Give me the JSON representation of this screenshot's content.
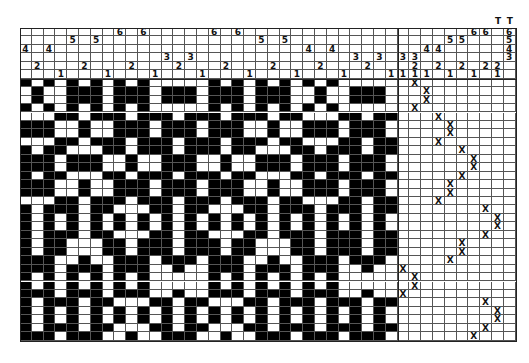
{
  "draft": {
    "shafts": 6,
    "threading": [
      4,
      2,
      4,
      1,
      5,
      2,
      5,
      1,
      6,
      2,
      6,
      1,
      3,
      2,
      3,
      1,
      6,
      2,
      6,
      1,
      5,
      2,
      5,
      1,
      4,
      2,
      4,
      1,
      3,
      2,
      3,
      1
    ],
    "tieup": [
      [
        3,
        1
      ],
      [
        3,
        2,
        1
      ],
      [
        4,
        1
      ],
      [
        4,
        2
      ],
      [
        5,
        1
      ],
      [
        5,
        2
      ],
      [
        6,
        1
      ],
      [
        6,
        2
      ],
      [
        2,
        1
      ],
      [
        6,
        5,
        4,
        3
      ]
    ],
    "tabby_labels": [
      "T",
      "T"
    ],
    "treadling": [
      1,
      2,
      2,
      1,
      3,
      4,
      4,
      3,
      5,
      6,
      6,
      5,
      4,
      4,
      3,
      7,
      8,
      8,
      7,
      5,
      5,
      4,
      0,
      1,
      1,
      0,
      7,
      8,
      8,
      7,
      6,
      6,
      5,
      5,
      4,
      3,
      3,
      2,
      2,
      2,
      2
    ],
    "mark": "X",
    "colors": {
      "filled": "#000000",
      "empty": "#ffffff",
      "grid": "#555555"
    }
  }
}
